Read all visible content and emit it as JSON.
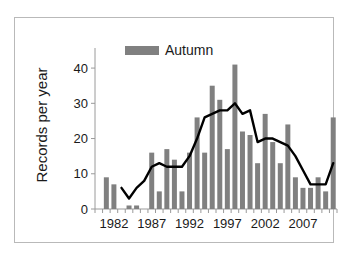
{
  "chart_data": {
    "type": "bar",
    "title": "",
    "xlabel": "",
    "ylabel": "Records per year",
    "ylim": [
      0,
      44
    ],
    "yticks": [
      0,
      10,
      20,
      30,
      40
    ],
    "xtick_labels": [
      "1982",
      "1987",
      "1992",
      "1997",
      "2002",
      "2007"
    ],
    "xtick_years": [
      1982,
      1987,
      1992,
      1997,
      2002,
      2007
    ],
    "grid": false,
    "legend_position": "top-left",
    "legend": [
      "Autumn"
    ],
    "categories": [
      1980,
      1981,
      1982,
      1983,
      1984,
      1985,
      1986,
      1987,
      1988,
      1989,
      1990,
      1991,
      1992,
      1993,
      1994,
      1995,
      1996,
      1997,
      1998,
      1999,
      2000,
      2001,
      2002,
      2003,
      2004,
      2005,
      2006,
      2007,
      2008,
      2009,
      2010,
      2011
    ],
    "series": [
      {
        "name": "Autumn",
        "type": "bar",
        "color": "#808080",
        "values": [
          0,
          9,
          7,
          0,
          1,
          1,
          0,
          16,
          5,
          17,
          14,
          5,
          16,
          26,
          16,
          35,
          31,
          17,
          41,
          22,
          21,
          13,
          27,
          19,
          13,
          24,
          9,
          6,
          6,
          9,
          5,
          26
        ]
      },
      {
        "name": "Trend",
        "type": "line",
        "color": "#000000",
        "values": [
          null,
          null,
          null,
          6,
          3,
          6,
          8,
          12,
          13,
          12,
          12,
          12,
          15,
          20,
          26,
          27,
          28,
          28,
          30,
          27,
          28,
          19,
          20,
          20,
          19,
          18,
          15,
          11,
          7,
          7,
          7,
          13
        ]
      }
    ]
  },
  "legend": {
    "autumn_label": "Autumn",
    "swatch_color": "#808080"
  },
  "axes": {
    "y_title": "Records per year"
  }
}
